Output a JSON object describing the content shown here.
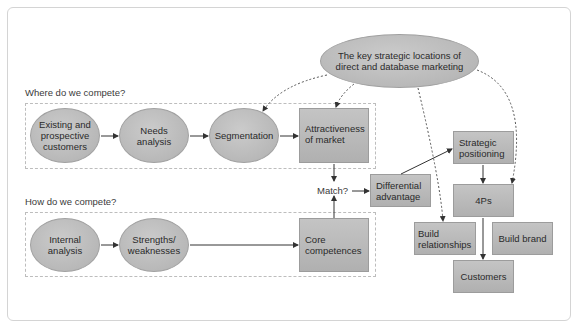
{
  "diagram": {
    "top_node": "The key strategic locations of direct and database marketing",
    "sections": {
      "where": "Where do we compete?",
      "how": "How do we compete?"
    },
    "where_row": [
      {
        "id": "existing",
        "label": "Existing and prospective customers",
        "shape": "ellipse"
      },
      {
        "id": "needs",
        "label": "Needs analysis",
        "shape": "ellipse"
      },
      {
        "id": "segmentation",
        "label": "Segmentation",
        "shape": "ellipse"
      },
      {
        "id": "attractiveness",
        "label": "Attractiveness of market",
        "shape": "box"
      }
    ],
    "how_row": [
      {
        "id": "internal",
        "label": "Internal analysis",
        "shape": "ellipse"
      },
      {
        "id": "strengths",
        "label": "Strengths/ weaknesses",
        "shape": "ellipse"
      },
      {
        "id": "core",
        "label": "Core competences",
        "shape": "box"
      }
    ],
    "match": "Match?",
    "differential": "Differential advantage",
    "strategic": "Strategic positioning",
    "fourps": "4Ps",
    "build_relationships": "Build relationships",
    "build_brand": "Build brand",
    "customers": "Customers",
    "edges": [
      [
        "existing",
        "needs"
      ],
      [
        "needs",
        "segmentation"
      ],
      [
        "segmentation",
        "attractiveness"
      ],
      [
        "internal",
        "strengths"
      ],
      [
        "strengths",
        "core"
      ],
      [
        "attractiveness",
        "match"
      ],
      [
        "core",
        "match"
      ],
      [
        "match",
        "differential"
      ],
      [
        "differential",
        "strategic"
      ],
      [
        "strategic",
        "fourps"
      ],
      [
        "fourps",
        "customers"
      ]
    ],
    "dashed_edges": [
      [
        "top_node",
        "segmentation"
      ],
      [
        "top_node",
        "attractiveness"
      ],
      [
        "top_node",
        "build_relationships"
      ],
      [
        "top_node",
        "fourps"
      ]
    ],
    "colors": {
      "node_fill": "#b8b8b8",
      "node_border": "#9c9c9c",
      "dashed_box": "#bdbdbd",
      "arrow": "#333333"
    }
  }
}
